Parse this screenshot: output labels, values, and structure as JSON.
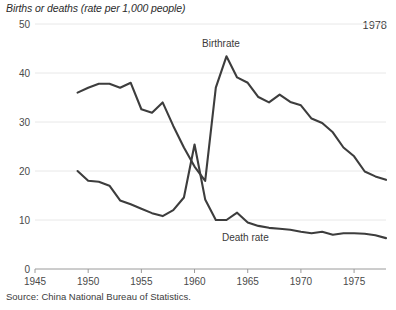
{
  "chart": {
    "title": "Births or deaths (rate per 1,000 people)",
    "corner_annotation": "1978",
    "source": "Source: China National Bureau of Statistics.",
    "line_color": "#3d3d3d",
    "grid_color": "#e8e8e8",
    "axis_color": "#9a9a9a"
  },
  "chart_data": {
    "type": "line",
    "title": "Births or deaths (rate per 1,000 people)",
    "xlabel": "",
    "ylabel": "Births or deaths (rate per 1,000 people)",
    "xlim": [
      1945,
      1978
    ],
    "ylim": [
      0,
      50
    ],
    "ytick_labels": [
      "0",
      "10",
      "20",
      "30",
      "40",
      "50"
    ],
    "ytick_values": [
      0,
      10,
      20,
      30,
      40,
      50
    ],
    "xtick_labels": [
      "1945",
      "1950",
      "1955",
      "1960",
      "1965",
      "1970",
      "1975"
    ],
    "xtick_values": [
      1945,
      1950,
      1955,
      1960,
      1965,
      1970,
      1975
    ],
    "grid": true,
    "legend_position": "inline-annotations",
    "annotations": [
      {
        "text": "Birthrate",
        "x": 1962,
        "y": 46
      },
      {
        "text": "Death rate",
        "x": 1966,
        "y": 8.5
      },
      {
        "text": "1978",
        "x": 1977,
        "y": 48
      }
    ],
    "x": [
      1949,
      1950,
      1951,
      1952,
      1953,
      1954,
      1955,
      1956,
      1957,
      1958,
      1959,
      1960,
      1961,
      1962,
      1963,
      1964,
      1965,
      1966,
      1967,
      1968,
      1969,
      1970,
      1971,
      1972,
      1973,
      1974,
      1975,
      1976,
      1977,
      1978
    ],
    "series": [
      {
        "name": "Birthrate",
        "values": [
          36.0,
          37.0,
          37.8,
          37.8,
          37.0,
          38.0,
          32.6,
          31.9,
          34.0,
          29.2,
          24.8,
          20.9,
          18.0,
          37.0,
          43.4,
          39.1,
          38.0,
          35.1,
          34.0,
          35.6,
          34.1,
          33.4,
          30.7,
          29.8,
          27.9,
          24.8,
          23.0,
          19.9,
          18.9,
          18.2
        ]
      },
      {
        "name": "Death rate",
        "values": [
          20.0,
          18.0,
          17.8,
          17.0,
          14.0,
          13.2,
          12.3,
          11.4,
          10.8,
          12.0,
          14.6,
          25.4,
          14.2,
          10.0,
          10.0,
          11.5,
          9.5,
          8.8,
          8.4,
          8.2,
          8.0,
          7.6,
          7.3,
          7.6,
          7.0,
          7.3,
          7.3,
          7.2,
          6.9,
          6.3
        ]
      }
    ]
  }
}
